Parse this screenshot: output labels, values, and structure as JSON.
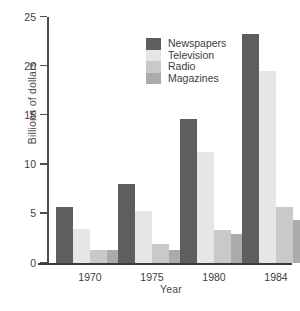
{
  "chart_data": {
    "type": "bar",
    "title": "",
    "subtitle": "",
    "xlabel": "Year",
    "ylabel": "Billions of dollars",
    "categories": [
      "1970",
      "1975",
      "1980",
      "1984"
    ],
    "series": [
      {
        "name": "Newspapers",
        "color": "#5e5e5e",
        "values": [
          5.7,
          8.0,
          14.6,
          23.3
        ]
      },
      {
        "name": "Television",
        "color": "#e6e6e6",
        "values": [
          3.5,
          5.3,
          11.3,
          19.5
        ]
      },
      {
        "name": "Radio",
        "color": "#c9c9c9",
        "values": [
          1.3,
          1.9,
          3.4,
          5.7
        ]
      },
      {
        "name": "Magazines",
        "color": "#ababab",
        "values": [
          1.3,
          1.3,
          2.9,
          4.4
        ]
      }
    ],
    "ylim": [
      0,
      25
    ],
    "yticks": [
      0,
      5,
      10,
      15,
      20,
      25
    ],
    "ytick_labels": [
      "0",
      "5",
      "10",
      "15",
      "20",
      "25"
    ],
    "grid": false,
    "legend_position": "top-left-inside",
    "legend_entries": [
      "Newspapers",
      "Television",
      "Radio",
      "Magazines"
    ],
    "annotations": []
  },
  "axis": {
    "y_title": "Billions of dollars",
    "x_title": "Year",
    "y_labels": [
      "25",
      "20",
      "15",
      "10",
      "5",
      "0"
    ],
    "x_labels": [
      "1970",
      "1975",
      "1980",
      "1984"
    ]
  },
  "legend": {
    "items": [
      {
        "label": "Newspapers",
        "swatch": "#5e5e5e"
      },
      {
        "label": "Television",
        "swatch": "#e6e6e6"
      },
      {
        "label": "Radio",
        "swatch": "#c9c9c9"
      },
      {
        "label": "Magazines",
        "swatch": "#ababab"
      }
    ]
  }
}
